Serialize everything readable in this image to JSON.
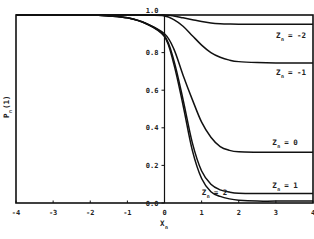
{
  "chart_data": {
    "type": "line",
    "title": "",
    "xlabel": "X_n",
    "ylabel": "P_n(1)",
    "xlim": [
      -4,
      4
    ],
    "ylim": [
      0.0,
      1.0
    ],
    "x_ticks": [
      "-4",
      "-3",
      "-2",
      "-1",
      "0",
      "1",
      "2",
      "3",
      "4"
    ],
    "y_ticks": [
      "0.0",
      "0.2",
      "0.4",
      "0.6",
      "0.8",
      "1.0"
    ],
    "grid": false,
    "x": [
      -4,
      -3,
      -2,
      -1.5,
      -1,
      -0.5,
      0,
      0.25,
      0.5,
      0.75,
      1,
      1.25,
      1.5,
      1.75,
      2,
      2.5,
      3,
      4
    ],
    "series": [
      {
        "name": "Z_n = -2",
        "label": "Z",
        "sub": "n",
        "value": "= -2",
        "values": [
          1.0,
          1.0,
          1.0,
          1.0,
          1.0,
          1.0,
          1.0,
          0.995,
          0.985,
          0.975,
          0.965,
          0.958,
          0.954,
          0.952,
          0.951,
          0.951,
          0.951,
          0.951
        ]
      },
      {
        "name": "Z_n = -1",
        "label": "Z",
        "sub": "n",
        "value": "= -1",
        "values": [
          1.0,
          1.0,
          1.0,
          1.0,
          1.0,
          1.0,
          0.995,
          0.975,
          0.94,
          0.89,
          0.84,
          0.8,
          0.775,
          0.76,
          0.752,
          0.747,
          0.745,
          0.745
        ]
      },
      {
        "name": "Z_n = 0",
        "label": "Z",
        "sub": "n",
        "value": "= 0",
        "values": [
          1.0,
          1.0,
          1.0,
          0.995,
          0.985,
          0.955,
          0.9,
          0.82,
          0.68,
          0.55,
          0.43,
          0.35,
          0.3,
          0.28,
          0.272,
          0.27,
          0.27,
          0.27
        ]
      },
      {
        "name": "Z_n = 1",
        "label": "Z",
        "sub": "n",
        "value": "= 1",
        "values": [
          1.0,
          1.0,
          1.0,
          0.995,
          0.985,
          0.955,
          0.89,
          0.76,
          0.55,
          0.32,
          0.17,
          0.1,
          0.07,
          0.058,
          0.052,
          0.05,
          0.05,
          0.05
        ]
      },
      {
        "name": "Z_n = 2",
        "label": "Z",
        "sub": "n",
        "value": "= 2",
        "values": [
          1.0,
          1.0,
          1.0,
          0.995,
          0.985,
          0.955,
          0.885,
          0.74,
          0.52,
          0.28,
          0.13,
          0.06,
          0.035,
          0.022,
          0.015,
          0.01,
          0.01,
          0.01
        ]
      }
    ],
    "annotations": [
      {
        "text": "Z_n = -2",
        "x": 3.0,
        "y": 0.88
      },
      {
        "text": "Z_n = -1",
        "x": 3.0,
        "y": 0.68
      },
      {
        "text": "Z_n = 0",
        "x": 2.9,
        "y": 0.31
      },
      {
        "text": "Z_n = 1",
        "x": 2.9,
        "y": 0.08
      },
      {
        "text": "Z_n = 2",
        "x": 1.0,
        "y": 0.04
      }
    ]
  },
  "axes": {
    "x_label_main": "X",
    "x_label_sub": "n",
    "y_label_main": "P",
    "y_label_sub": "n",
    "y_label_arg": "(1)"
  }
}
